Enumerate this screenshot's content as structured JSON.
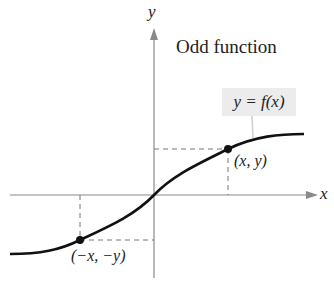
{
  "diagram": {
    "title": "Odd function",
    "function_label": "y = f(x)",
    "axis_labels": {
      "x": "x",
      "y": "y"
    },
    "points": [
      {
        "label": "(x, y)",
        "quadrant": "I"
      },
      {
        "label": "(−x, −y)",
        "quadrant": "III"
      }
    ],
    "colors": {
      "curve": "#111111",
      "axes": "#888888",
      "label_box": "#ececec"
    }
  }
}
